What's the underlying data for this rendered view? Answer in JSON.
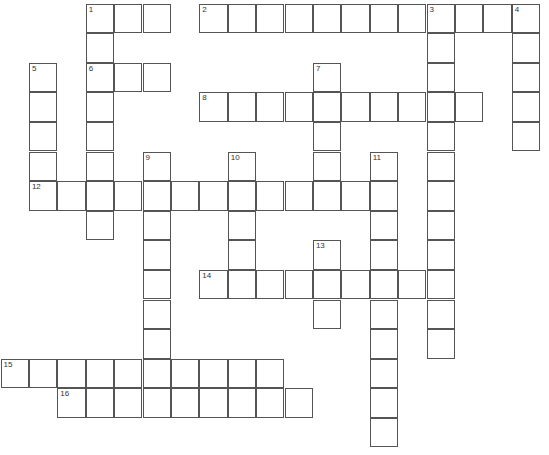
{
  "puzzle": {
    "type": "crossword",
    "grid": {
      "origin_x": 1,
      "origin_y": 4,
      "cell_w": 28.4,
      "cell_h": 29.6
    },
    "colors": {
      "line": "#555555",
      "background": "#ffffff",
      "number": "#333333"
    },
    "words": [
      {
        "number": 1,
        "direction": "across",
        "row": 0,
        "col": 3,
        "length": 3
      },
      {
        "number": 1,
        "direction": "down",
        "row": 0,
        "col": 3,
        "length": 8
      },
      {
        "number": 2,
        "direction": "across",
        "row": 0,
        "col": 7,
        "length": 12
      },
      {
        "number": 3,
        "direction": "down",
        "row": 0,
        "col": 15,
        "length": 12
      },
      {
        "number": 4,
        "direction": "down",
        "row": 0,
        "col": 18,
        "length": 5
      },
      {
        "number": 5,
        "direction": "down",
        "row": 2,
        "col": 1,
        "length": 5
      },
      {
        "number": 6,
        "direction": "across",
        "row": 2,
        "col": 3,
        "length": 3
      },
      {
        "number": 7,
        "direction": "down",
        "row": 2,
        "col": 11,
        "length": 5
      },
      {
        "number": 8,
        "direction": "across",
        "row": 3,
        "col": 7,
        "length": 10
      },
      {
        "number": 9,
        "direction": "down",
        "row": 5,
        "col": 5,
        "length": 9
      },
      {
        "number": 10,
        "direction": "down",
        "row": 5,
        "col": 8,
        "length": 5
      },
      {
        "number": 11,
        "direction": "down",
        "row": 5,
        "col": 13,
        "length": 10
      },
      {
        "number": 12,
        "direction": "across",
        "row": 6,
        "col": 1,
        "length": 13
      },
      {
        "number": 13,
        "direction": "down",
        "row": 8,
        "col": 11,
        "length": 3
      },
      {
        "number": 14,
        "direction": "across",
        "row": 9,
        "col": 7,
        "length": 9
      },
      {
        "number": 15,
        "direction": "across",
        "row": 12,
        "col": 0,
        "length": 10
      },
      {
        "number": 16,
        "direction": "across",
        "row": 13,
        "col": 2,
        "length": 9
      }
    ]
  }
}
